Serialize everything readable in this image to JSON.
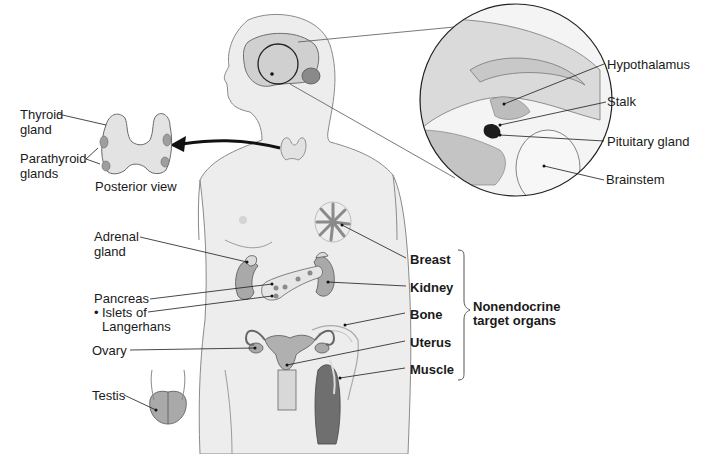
{
  "diagram": {
    "colors": {
      "body_fill": "#ececec",
      "body_stroke": "#8a8a8a",
      "organ_fill": "#a9a9a9",
      "organ_dark": "#6f6f6f",
      "line": "#1a1a1a",
      "pituitary": "#1c1c1c"
    },
    "thyroid_inset": {
      "thyroid_label_1": "Thyroid",
      "thyroid_label_2": "gland",
      "parathyroid_label_1": "Parathyroid",
      "parathyroid_label_2": "glands",
      "caption": "Posterior view"
    },
    "brain_inset": {
      "labels": [
        "Hypothalamus",
        "Stalk",
        "Pituitary gland",
        "Brainstem"
      ]
    },
    "left_labels": {
      "adrenal_1": "Adrenal",
      "adrenal_2": "gland",
      "pancreas": "Pancreas",
      "islets_bullet": "•",
      "islets_1": "Islets of",
      "islets_2": "Langerhans",
      "ovary": "Ovary",
      "testis": "Testis"
    },
    "target_organs": {
      "items": [
        "Breast",
        "Kidney",
        "Bone",
        "Uterus",
        "Muscle"
      ],
      "group_label_1": "Nonendocrine",
      "group_label_2": "target organs"
    }
  }
}
